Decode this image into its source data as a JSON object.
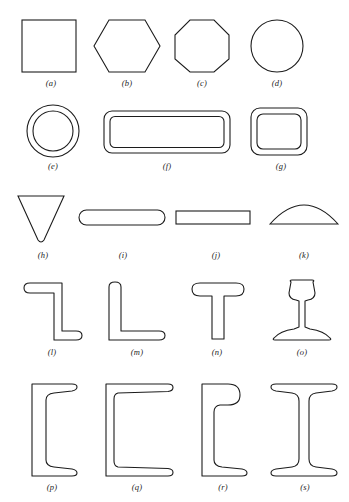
{
  "plate": {
    "title": "Structural and bar cross-section shapes plate",
    "background_color": "#ffffff",
    "line_color": "#1c1c1c",
    "caption_color": "#1c1c1c"
  },
  "rows": [
    {
      "row_label": "row-1-solid-polygons",
      "items": [
        {
          "caption": "(a)",
          "letter": "a",
          "shape_name": "square-bar",
          "icon": "square-shape"
        },
        {
          "caption": "(b)",
          "letter": "b",
          "shape_name": "hexagonal-bar",
          "icon": "hexagon-shape"
        },
        {
          "caption": "(c)",
          "letter": "c",
          "shape_name": "octagonal-bar",
          "icon": "octagon-shape"
        },
        {
          "caption": "(d)",
          "letter": "d",
          "shape_name": "round-bar",
          "icon": "circle-shape"
        }
      ]
    },
    {
      "row_label": "row-2-hollow-tubes",
      "items": [
        {
          "caption": "(e)",
          "letter": "e",
          "shape_name": "round-tube",
          "icon": "annulus-shape"
        },
        {
          "caption": "(f)",
          "letter": "f",
          "shape_name": "rectangular-tube",
          "icon": "rounded-rectangle-tube-shape"
        },
        {
          "caption": "(g)",
          "letter": "g",
          "shape_name": "square-tube",
          "icon": "rounded-square-tube-shape"
        }
      ]
    },
    {
      "row_label": "row-3-bars-and-plates",
      "items": [
        {
          "caption": "(h)",
          "letter": "h",
          "shape_name": "triangular-bar",
          "icon": "inverted-triangle-shape"
        },
        {
          "caption": "(i)",
          "letter": "i",
          "shape_name": "round-edge-flat-bar",
          "icon": "stadium-shape"
        },
        {
          "caption": "(j)",
          "letter": "j",
          "shape_name": "flat-bar",
          "icon": "rectangle-shape"
        },
        {
          "caption": "(k)",
          "letter": "k",
          "shape_name": "half-round-bar",
          "icon": "half-round-shape"
        }
      ]
    },
    {
      "row_label": "row-4-angle-tee-and-rail",
      "items": [
        {
          "caption": "(l)",
          "letter": "l",
          "shape_name": "zee-section",
          "icon": "z-section-shape"
        },
        {
          "caption": "(m)",
          "letter": "m",
          "shape_name": "angle-section",
          "icon": "l-angle-shape"
        },
        {
          "caption": "(n)",
          "letter": "n",
          "shape_name": "tee-section",
          "icon": "t-section-shape"
        },
        {
          "caption": "(o)",
          "letter": "o",
          "shape_name": "rail-section",
          "icon": "rail-shape"
        }
      ]
    },
    {
      "row_label": "row-5-channels-and-beams",
      "items": [
        {
          "caption": "(p)",
          "letter": "p",
          "shape_name": "channel-section-tapered-flange",
          "icon": "channel-shape"
        },
        {
          "caption": "(q)",
          "letter": "q",
          "shape_name": "channel-section-wide",
          "icon": "wide-channel-shape"
        },
        {
          "caption": "(r)",
          "letter": "r",
          "shape_name": "bulb-angle-section",
          "icon": "bulb-angle-shape"
        },
        {
          "caption": "(s)",
          "letter": "s",
          "shape_name": "i-beam-section",
          "icon": "i-beam-shape"
        }
      ]
    }
  ]
}
